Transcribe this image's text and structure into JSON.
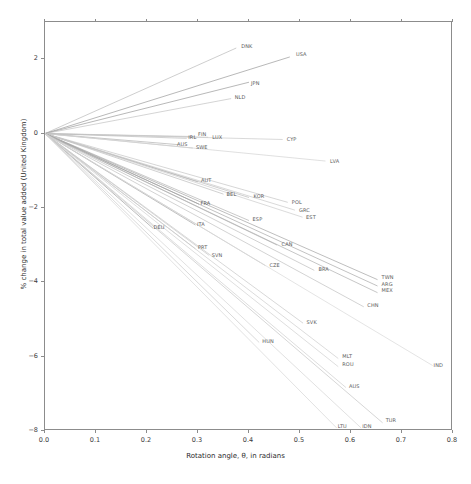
{
  "chart_data": {
    "type": "line",
    "title": "",
    "xlabel": "Rotation angle, θ, in radians",
    "ylabel": "% change in total value added (United Kingdom)",
    "xlim": [
      0.0,
      0.8
    ],
    "ylim": [
      -8,
      3
    ],
    "grid": false,
    "legend": "none",
    "xticks": [
      "0.0",
      "0.1",
      "0.2",
      "0.3",
      "0.4",
      "0.5",
      "0.6",
      "0.7",
      "0.8"
    ],
    "xtick_values": [
      0.0,
      0.1,
      0.2,
      0.3,
      0.4,
      0.5,
      0.6,
      0.7,
      0.8
    ],
    "yticks": [
      "2",
      "0",
      "−2",
      "−4",
      "−6",
      "−8"
    ],
    "ytick_values": [
      2,
      0,
      -2,
      -4,
      -6,
      -8
    ],
    "origin": {
      "x": 0.0,
      "y": 0.0
    },
    "series": [
      {
        "name": "DNK",
        "x_end": 0.375,
        "y_end": 2.3,
        "label_x": 0.385,
        "label_y": 2.33,
        "color": "#b9b9b9"
      },
      {
        "name": "USA",
        "x_end": 0.48,
        "y_end": 2.06,
        "label_x": 0.492,
        "label_y": 2.11,
        "color": "#9a9a9a"
      },
      {
        "name": "JPN",
        "x_end": 0.4,
        "y_end": 1.38,
        "label_x": 0.404,
        "label_y": 1.33,
        "color": "#9a9a9a"
      },
      {
        "name": "NLD",
        "x_end": 0.365,
        "y_end": 0.94,
        "label_x": 0.372,
        "label_y": 0.95,
        "color": "#c2c2c2"
      },
      {
        "name": "CYP",
        "x_end": 0.466,
        "y_end": -0.16,
        "label_x": 0.474,
        "label_y": -0.18,
        "color": "#c9c9c9"
      },
      {
        "name": "LUX",
        "x_end": 0.32,
        "y_end": -0.1,
        "label_x": 0.328,
        "label_y": -0.11,
        "color": "#c9c9c9"
      },
      {
        "name": "FIN",
        "x_end": 0.294,
        "y_end": -0.08,
        "label_x": 0.3,
        "label_y": -0.03,
        "color": "#c4c4c4"
      },
      {
        "name": "IRL",
        "x_end": 0.278,
        "y_end": -0.13,
        "label_x": 0.281,
        "label_y": -0.11,
        "color": "#bdbdbd"
      },
      {
        "name": "AUS",
        "x_end": 0.262,
        "y_end": -0.3,
        "label_x": 0.259,
        "label_y": -0.3,
        "color": "#b0b0b0"
      },
      {
        "name": "SWE",
        "x_end": 0.29,
        "y_end": -0.39,
        "label_x": 0.296,
        "label_y": -0.4,
        "color": "#c0c0c0"
      },
      {
        "name": "LVA",
        "x_end": 0.55,
        "y_end": -0.74,
        "label_x": 0.559,
        "label_y": -0.76,
        "color": "#d2d2d2"
      },
      {
        "name": "AUT",
        "x_end": 0.3,
        "y_end": -1.3,
        "label_x": 0.306,
        "label_y": -1.28,
        "color": "#a8a8a8"
      },
      {
        "name": "BEL",
        "x_end": 0.35,
        "y_end": -1.63,
        "label_x": 0.356,
        "label_y": -1.64,
        "color": "#bcbcbc"
      },
      {
        "name": "KOR",
        "x_end": 0.4,
        "y_end": -1.72,
        "label_x": 0.409,
        "label_y": -1.71,
        "color": "#bababa"
      },
      {
        "name": "POL",
        "x_end": 0.476,
        "y_end": -1.85,
        "label_x": 0.484,
        "label_y": -1.87,
        "color": "#c4c4c4"
      },
      {
        "name": "GRC",
        "x_end": 0.49,
        "y_end": -2.06,
        "label_x": 0.498,
        "label_y": -2.07,
        "color": "#c8c8c8"
      },
      {
        "name": "EST",
        "x_end": 0.505,
        "y_end": -2.25,
        "label_x": 0.512,
        "label_y": -2.26,
        "color": "#cccccc"
      },
      {
        "name": "FRA",
        "x_end": 0.302,
        "y_end": -1.9,
        "label_x": 0.305,
        "label_y": -1.9,
        "color": "#8f8f8f"
      },
      {
        "name": "ESP",
        "x_end": 0.4,
        "y_end": -2.34,
        "label_x": 0.407,
        "label_y": -2.33,
        "color": "#b3b3b3"
      },
      {
        "name": "ITA",
        "x_end": 0.295,
        "y_end": -2.46,
        "label_x": 0.298,
        "label_y": -2.46,
        "color": "#a5a5a5"
      },
      {
        "name": "DEU",
        "x_end": 0.212,
        "y_end": -2.55,
        "label_x": 0.213,
        "label_y": -2.53,
        "color": "#9d9d9d"
      },
      {
        "name": "CAN",
        "x_end": 0.455,
        "y_end": -3.0,
        "label_x": 0.464,
        "label_y": -2.99,
        "color": "#b6b6b6"
      },
      {
        "name": "PRT",
        "x_end": 0.295,
        "y_end": -3.1,
        "label_x": 0.3,
        "label_y": -3.09,
        "color": "#c0c0c0"
      },
      {
        "name": "SVN",
        "x_end": 0.322,
        "y_end": -3.28,
        "label_x": 0.327,
        "label_y": -3.28,
        "color": "#c6c6c6"
      },
      {
        "name": "CZE",
        "x_end": 0.432,
        "y_end": -3.55,
        "label_x": 0.44,
        "label_y": -3.55,
        "color": "#c1c1c1"
      },
      {
        "name": "BRA",
        "x_end": 0.528,
        "y_end": -3.68,
        "label_x": 0.536,
        "label_y": -3.68,
        "color": "#bdbdbd"
      },
      {
        "name": "TWN",
        "x_end": 0.652,
        "y_end": -3.93,
        "label_x": 0.66,
        "label_y": -3.88,
        "color": "#a2a2a2"
      },
      {
        "name": "ARG",
        "x_end": 0.652,
        "y_end": -4.1,
        "label_x": 0.66,
        "label_y": -4.06,
        "color": "#a8a8a8"
      },
      {
        "name": "MEX",
        "x_end": 0.652,
        "y_end": -4.28,
        "label_x": 0.66,
        "label_y": -4.23,
        "color": "#aeaeae"
      },
      {
        "name": "CHN",
        "x_end": 0.625,
        "y_end": -4.66,
        "label_x": 0.632,
        "label_y": -4.64,
        "color": "#c0c0c0"
      },
      {
        "name": "SVK",
        "x_end": 0.506,
        "y_end": -5.1,
        "label_x": 0.513,
        "label_y": -5.09,
        "color": "#c7c7c7"
      },
      {
        "name": "HUN",
        "x_end": 0.42,
        "y_end": -5.62,
        "label_x": 0.426,
        "label_y": -5.61,
        "color": "#cacaca"
      },
      {
        "name": "MLT",
        "x_end": 0.575,
        "y_end": -6.05,
        "label_x": 0.583,
        "label_y": -6.02,
        "color": "#cdcdcd"
      },
      {
        "name": "ROU",
        "x_end": 0.575,
        "y_end": -6.27,
        "label_x": 0.583,
        "label_y": -6.23,
        "color": "#d0d0d0"
      },
      {
        "name": "IND",
        "x_end": 0.76,
        "y_end": -6.24,
        "label_x": 0.762,
        "label_y": -6.24,
        "color": "#d8d8d8"
      },
      {
        "name": "AUS2",
        "x_end": 0.59,
        "y_end": -6.83,
        "label_x": 0.596,
        "label_y": -6.82,
        "color": "#cfcfcf"
      },
      {
        "name": "TUR",
        "x_end": 0.662,
        "y_end": -7.78,
        "label_x": 0.668,
        "label_y": -7.72,
        "color": "#c4c4c4"
      },
      {
        "name": "IDN",
        "x_end": 0.62,
        "y_end": -7.92,
        "label_x": 0.622,
        "label_y": -7.88,
        "color": "#d4d4d4"
      },
      {
        "name": "LTU",
        "x_end": 0.572,
        "y_end": -7.92,
        "label_x": 0.574,
        "label_y": -7.88,
        "color": "#d6d6d6"
      }
    ]
  },
  "axes": {
    "xlabel": "Rotation angle, θ, in radians",
    "ylabel": "% change in total value added (United Kingdom)"
  }
}
